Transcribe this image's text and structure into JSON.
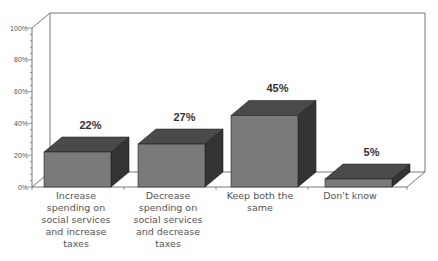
{
  "chart_data": {
    "type": "bar",
    "style": "3d",
    "title": "",
    "xlabel": "",
    "ylabel": "",
    "categories": [
      "Increase spending on social services and increase taxes",
      "Decrease spending on social services and decrease taxes",
      "Keep both the same",
      "Don't know"
    ],
    "category_lines": [
      "Increase\nspending on\nsocial  services\nand  increase\ntaxes",
      "Decrease\nspending on\nsocial  services\nand  decrease\ntaxes",
      "Keep both the\nsame",
      "Don't know"
    ],
    "values": [
      22,
      27,
      45,
      5
    ],
    "value_labels": [
      "22%",
      "27%",
      "45%",
      "5%"
    ],
    "ylim": [
      0,
      100
    ],
    "yticks": [
      "0%",
      "20%",
      "40%",
      "60%",
      "80%",
      "100%"
    ],
    "grid": false,
    "legend": null
  },
  "colors": {
    "bar_front": "#7a7a7a",
    "bar_top": "#4a4a4a",
    "bar_side": "#333333",
    "frame": "#555555",
    "axis_text": "#555555",
    "value_text": "#333333"
  }
}
